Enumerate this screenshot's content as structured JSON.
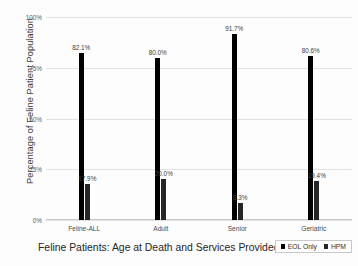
{
  "chart_data": {
    "type": "bar",
    "title": "",
    "xlabel": "Feline Patients: Age at Death and Services Provided",
    "ylabel": "Percentage of Feline Patient Population",
    "categories": [
      "Feline-ALL",
      "Adult",
      "Senior",
      "Geriatric"
    ],
    "series": [
      {
        "name": "EOL Only",
        "color": "#000000",
        "values": [
          82.1,
          80.0,
          91.7,
          80.6
        ],
        "labels": [
          "82.1%",
          "80.0%",
          "91.7%",
          "80.6%"
        ]
      },
      {
        "name": "HPM",
        "color": "#262626",
        "values": [
          17.9,
          20.0,
          8.3,
          19.4
        ],
        "labels": [
          "17.9%",
          "20.0%",
          "8.3%",
          "19.4%"
        ]
      }
    ],
    "ylim": [
      0,
      100
    ],
    "yticks": [
      0,
      25,
      50,
      75,
      100
    ],
    "ytick_labels": [
      "0%",
      "25%",
      "50%",
      "75%",
      "100%"
    ],
    "grid": true,
    "legend_position": "bottom-right"
  },
  "legend": {
    "items": [
      {
        "label": "EOL Only",
        "color": "#000000"
      },
      {
        "label": "HPM",
        "color": "#262626"
      }
    ]
  }
}
